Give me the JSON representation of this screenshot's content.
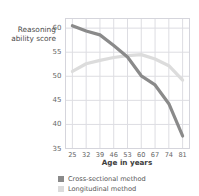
{
  "chart_data": {
    "type": "line",
    "title": "",
    "xlabel": "Age in years",
    "ylabel": "Reasoning ability score",
    "ylabel_line1": "Reasoning",
    "ylabel_line2": "ability score",
    "x": [
      25,
      32,
      39,
      46,
      53,
      60,
      67,
      74,
      81
    ],
    "xticks": [
      "25",
      "32",
      "39",
      "46",
      "53",
      "60",
      "67",
      "74",
      "81"
    ],
    "yticks": [
      "35",
      "40",
      "45",
      "50",
      "55",
      "60"
    ],
    "xlim": [
      21.5,
      84.5
    ],
    "ylim": [
      35,
      62
    ],
    "grid": true,
    "legend_position": "bottom-left",
    "series": [
      {
        "name": "Cross-sectional method",
        "color": "#8a8a8a",
        "values": [
          60.5,
          59.4,
          58.6,
          56.4,
          54.0,
          50.1,
          48.2,
          44.3,
          37.6
        ]
      },
      {
        "name": "Longitudinal method",
        "color": "#dcdcdc",
        "values": [
          51.0,
          52.6,
          53.3,
          53.9,
          54.3,
          54.5,
          53.6,
          52.2,
          49.2
        ]
      }
    ]
  },
  "legend": {
    "items": [
      {
        "label": "Cross-sectional method",
        "color": "#8a8a8a"
      },
      {
        "label": "Longitudinal method",
        "color": "#dcdcdc"
      }
    ]
  },
  "colors": {
    "cross_sectional": "#8a8a8a",
    "longitudinal": "#dcdcdc",
    "grid": "#dddde2",
    "axis_text": "#666666",
    "title_text": "#3d3d3d"
  }
}
